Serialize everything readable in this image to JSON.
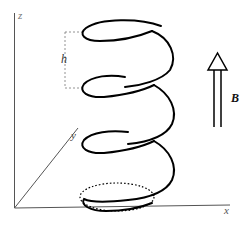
{
  "figure": {
    "axes": {
      "x_label": "x",
      "y_label": "y",
      "z_label": "z"
    },
    "pitch_label": "h",
    "field_label": "B",
    "helix": {
      "turns_visible": 4,
      "projection": "dotted circle on the x-y plane"
    },
    "colors": {
      "axis": "#555555",
      "helix": "#000000",
      "dashed": "#777777",
      "arrow": "#000000"
    }
  }
}
